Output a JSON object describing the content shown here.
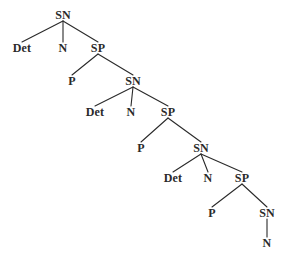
{
  "figure": {
    "name": "recursive-syntax-tree",
    "background_color": "#ffffff",
    "ink_color": "#2a2a2a"
  },
  "labels": {
    "sn": "SN",
    "sp": "SP",
    "det": "Det",
    "n": "N",
    "p": "P"
  },
  "nodes": [
    {
      "id": "sn1",
      "label": "SN",
      "x": 63,
      "y": 15
    },
    {
      "id": "det1",
      "label": "Det",
      "x": 22,
      "y": 48
    },
    {
      "id": "n1",
      "label": "N",
      "x": 63,
      "y": 48
    },
    {
      "id": "sp1",
      "label": "SP",
      "x": 98,
      "y": 48
    },
    {
      "id": "p1",
      "label": "P",
      "x": 72,
      "y": 81
    },
    {
      "id": "sn2",
      "label": "SN",
      "x": 133,
      "y": 81
    },
    {
      "id": "det2",
      "label": "Det",
      "x": 95,
      "y": 112
    },
    {
      "id": "n2",
      "label": "N",
      "x": 131,
      "y": 112
    },
    {
      "id": "sp2",
      "label": "SP",
      "x": 168,
      "y": 112
    },
    {
      "id": "p2",
      "label": "P",
      "x": 141,
      "y": 148
    },
    {
      "id": "sn3",
      "label": "SN",
      "x": 201,
      "y": 148
    },
    {
      "id": "det3",
      "label": "Det",
      "x": 173,
      "y": 178
    },
    {
      "id": "n3",
      "label": "N",
      "x": 208,
      "y": 178
    },
    {
      "id": "sp3",
      "label": "SP",
      "x": 242,
      "y": 178
    },
    {
      "id": "p3",
      "label": "P",
      "x": 212,
      "y": 213
    },
    {
      "id": "sn4",
      "label": "SN",
      "x": 267,
      "y": 213
    },
    {
      "id": "n4",
      "label": "N",
      "x": 267,
      "y": 243
    }
  ],
  "edges": [
    {
      "from": "sn1",
      "to": "det1"
    },
    {
      "from": "sn1",
      "to": "n1"
    },
    {
      "from": "sn1",
      "to": "sp1"
    },
    {
      "from": "sp1",
      "to": "p1"
    },
    {
      "from": "sp1",
      "to": "sn2"
    },
    {
      "from": "sn2",
      "to": "det2"
    },
    {
      "from": "sn2",
      "to": "n2"
    },
    {
      "from": "sn2",
      "to": "sp2"
    },
    {
      "from": "sp2",
      "to": "p2"
    },
    {
      "from": "sp2",
      "to": "sn3"
    },
    {
      "from": "sn3",
      "to": "det3"
    },
    {
      "from": "sn3",
      "to": "n3"
    },
    {
      "from": "sn3",
      "to": "sp3"
    },
    {
      "from": "sp3",
      "to": "p3"
    },
    {
      "from": "sp3",
      "to": "sn4"
    },
    {
      "from": "sn4",
      "to": "n4"
    }
  ]
}
